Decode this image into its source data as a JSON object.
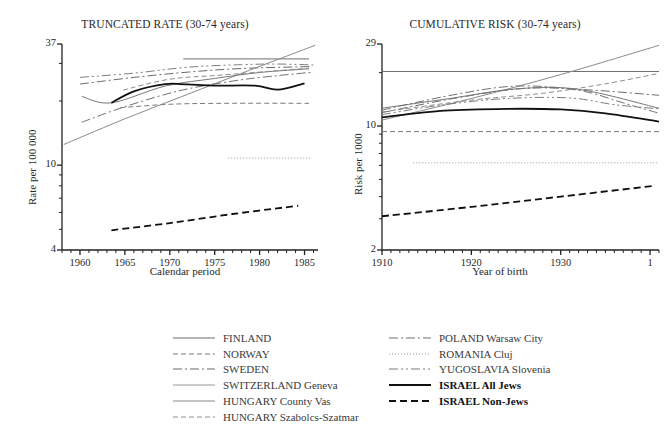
{
  "chart_data": [
    {
      "type": "line",
      "title": "TRUNCATED RATE (30-74 years)",
      "xlabel": "Calendar period",
      "ylabel": "Rate per 100 000",
      "xlim": [
        1958,
        1986.5
      ],
      "ylim": [
        4,
        37
      ],
      "yscale": "log",
      "grid": false,
      "xticks": [
        1960,
        1965,
        1970,
        1975,
        1980,
        1985
      ],
      "xtick_labels": [
        "1960",
        "1965",
        "1970",
        "1975",
        "1980",
        "1985"
      ],
      "yticks": [
        4,
        10,
        37
      ],
      "ytick_labels": [
        "4",
        "10",
        "37"
      ],
      "legend_position": "below",
      "series": [
        {
          "name": "FINLAND",
          "style": "solid",
          "color": "#6f6f6f",
          "width": 1.0,
          "x": [
            1971.5,
            1985.5
          ],
          "y": [
            31.5,
            31.5
          ]
        },
        {
          "name": "NORWAY",
          "style": "dashed",
          "color": "#7a7a7a",
          "width": 1.0,
          "x": [
            1964.5,
            1970,
            1976,
            1985.5
          ],
          "y": [
            18.6,
            19.3,
            19.5,
            19.5
          ]
        },
        {
          "name": "SWEDEN",
          "style": "dashdot",
          "color": "#6a6a6a",
          "width": 1.0,
          "x": [
            1960,
            1966,
            1972,
            1978,
            1985.8
          ],
          "y": [
            24.0,
            25.8,
            27.3,
            28.4,
            29.0
          ]
        },
        {
          "name": "SWITZERLAND Geneva",
          "style": "solid",
          "color": "#8a8a8a",
          "width": 1.0,
          "x": [
            1958.2,
            1965,
            1972,
            1979,
            1986.2
          ],
          "y": [
            12.5,
            16.5,
            21.5,
            28.0,
            36.5
          ]
        },
        {
          "name": "HUNGARY County Vas",
          "style": "solid",
          "color": "#787878",
          "width": 1.0,
          "x": [
            1960.2,
            1963.5,
            1969.5,
            1975,
            1980,
            1985.5
          ],
          "y": [
            21.0,
            19.6,
            23.5,
            25.5,
            27.2,
            28.3
          ]
        },
        {
          "name": "HUNGARY Szabolcs-Szatmar",
          "style": "dashed",
          "color": "#8d8d8d",
          "width": 1.0,
          "x": [
            1964.8,
            1970,
            1976,
            1985.5
          ],
          "y": [
            22.5,
            25.3,
            26.5,
            28.5
          ]
        },
        {
          "name": "POLAND Warsaw City",
          "style": "dashdot",
          "color": "#717171",
          "width": 1.0,
          "x": [
            1960.2,
            1965,
            1971,
            1977,
            1982,
            1986
          ],
          "y": [
            15.9,
            18.8,
            22.3,
            24.8,
            26.3,
            27.3
          ]
        },
        {
          "name": "ROMANIA Cluj",
          "style": "dotted",
          "color": "#9a9a9a",
          "width": 1.0,
          "x": [
            1976.5,
            1985.8
          ],
          "y": [
            10.8,
            10.8
          ]
        },
        {
          "name": "YUGOSLAVIA Slovenia",
          "style": "dashdotdot",
          "color": "#7d7d7d",
          "width": 1.0,
          "x": [
            1960,
            1966,
            1972,
            1978,
            1982,
            1986
          ],
          "y": [
            25.8,
            27.0,
            28.8,
            29.6,
            29.8,
            29.5
          ]
        },
        {
          "name": "ISRAEL All Jews",
          "style": "solid",
          "color": "#111111",
          "width": 1.8,
          "x": [
            1963.5,
            1966,
            1969.5,
            1972,
            1975,
            1979.5,
            1982,
            1985
          ],
          "y": [
            19.6,
            22.2,
            24.0,
            23.9,
            23.6,
            23.6,
            22.6,
            24.2
          ]
        },
        {
          "name": "ISRAEL Non-Jews",
          "style": "dashed",
          "color": "#111111",
          "width": 1.8,
          "x": [
            1963.5,
            1970,
            1977,
            1984.3
          ],
          "y": [
            4.95,
            5.35,
            5.9,
            6.45
          ]
        }
      ]
    },
    {
      "type": "line",
      "title": "CUMULATIVE RISK (30-74 years)",
      "xlabel": "Year of birth",
      "ylabel": "Risk per 1000",
      "xlim": [
        1910,
        1941
      ],
      "ylim": [
        2,
        29
      ],
      "yscale": "log",
      "grid": false,
      "xticks": [
        1910,
        1920,
        1930,
        1940
      ],
      "xtick_labels": [
        "1910",
        "1920",
        "1930",
        "1"
      ],
      "yticks": [
        2,
        10,
        29
      ],
      "ytick_labels": [
        "2",
        "10",
        "29"
      ],
      "legend_position": "below",
      "series": [
        {
          "name": "FINLAND",
          "style": "solid",
          "color": "#6f6f6f",
          "width": 1.0,
          "x": [
            1910,
            1941
          ],
          "y": [
            20.3,
            20.3
          ]
        },
        {
          "name": "NORWAY",
          "style": "dashed",
          "color": "#7a7a7a",
          "width": 1.0,
          "x": [
            1910,
            1941
          ],
          "y": [
            9.3,
            9.3
          ]
        },
        {
          "name": "SWEDEN",
          "style": "dashdot",
          "color": "#6a6a6a",
          "width": 1.0,
          "x": [
            1910,
            1918,
            1926,
            1933,
            1941
          ],
          "y": [
            11.9,
            14.3,
            16.3,
            16.0,
            14.9
          ]
        },
        {
          "name": "SWITZERLAND Geneva",
          "style": "solid",
          "color": "#8a8a8a",
          "width": 1.0,
          "x": [
            1910,
            1920,
            1930,
            1941
          ],
          "y": [
            10.8,
            14.3,
            19.5,
            28.5
          ]
        },
        {
          "name": "HUNGARY County Vas",
          "style": "solid",
          "color": "#787878",
          "width": 1.0,
          "x": [
            1910,
            1918,
            1925,
            1932,
            1941
          ],
          "y": [
            12.6,
            14.4,
            16.2,
            16.1,
            12.6
          ]
        },
        {
          "name": "HUNGARY Szabolcs-Szatmar",
          "style": "dashed",
          "color": "#8d8d8d",
          "width": 1.0,
          "x": [
            1910,
            1920,
            1928,
            1935,
            1941
          ],
          "y": [
            12.0,
            14.0,
            15.3,
            17.3,
            19.8
          ]
        },
        {
          "name": "POLAND Warsaw City",
          "style": "dashdot",
          "color": "#717171",
          "width": 1.0,
          "x": [
            1910,
            1918,
            1925,
            1932,
            1937,
            1941
          ],
          "y": [
            12.3,
            15.0,
            16.8,
            15.9,
            13.5,
            11.8
          ]
        },
        {
          "name": "ROMANIA Cluj",
          "style": "dotted",
          "color": "#9a9a9a",
          "width": 1.0,
          "x": [
            1913.5,
            1941
          ],
          "y": [
            6.2,
            6.2
          ]
        },
        {
          "name": "YUGOSLAVIA Slovenia",
          "style": "dashdotdot",
          "color": "#7d7d7d",
          "width": 1.0,
          "x": [
            1910,
            1917,
            1924,
            1931,
            1936,
            1941
          ],
          "y": [
            11.6,
            13.2,
            14.3,
            14.4,
            13.2,
            12.5
          ]
        },
        {
          "name": "ISRAEL All Jews",
          "style": "solid",
          "color": "#111111",
          "width": 1.8,
          "x": [
            1910,
            1917,
            1924,
            1930,
            1935,
            1941
          ],
          "y": [
            11.2,
            12.2,
            12.5,
            12.4,
            11.8,
            10.6
          ]
        },
        {
          "name": "ISRAEL Non-Jews",
          "style": "dashed",
          "color": "#111111",
          "width": 1.8,
          "x": [
            1910,
            1920,
            1930,
            1940.5
          ],
          "y": [
            3.1,
            3.5,
            4.0,
            4.6
          ]
        }
      ]
    }
  ],
  "legend": {
    "columns": [
      {
        "items": [
          {
            "label": "FINLAND",
            "style": "solid",
            "color": "#6f6f6f",
            "width": 1.2,
            "bold": false
          },
          {
            "label": "NORWAY",
            "style": "dashed",
            "color": "#7a7a7a",
            "width": 1.2,
            "bold": false
          },
          {
            "label": "SWEDEN",
            "style": "dashdot",
            "color": "#6a6a6a",
            "width": 1.2,
            "bold": false
          },
          {
            "label": "SWITZERLAND Geneva",
            "style": "solid",
            "color": "#9a9a9a",
            "width": 1.2,
            "bold": false
          },
          {
            "label": "HUNGARY County Vas",
            "style": "solid",
            "color": "#8a8a8a",
            "width": 1.2,
            "bold": false
          },
          {
            "label": "HUNGARY Szabolcs-Szatmar",
            "style": "dashed",
            "color": "#8d8d8d",
            "width": 1.2,
            "bold": false
          }
        ]
      },
      {
        "items": [
          {
            "label": "POLAND Warsaw City",
            "style": "dashdot",
            "color": "#717171",
            "width": 1.2,
            "bold": false
          },
          {
            "label": "ROMANIA Cluj",
            "style": "dotted",
            "color": "#9a9a9a",
            "width": 1.2,
            "bold": false
          },
          {
            "label": "YUGOSLAVIA Slovenia",
            "style": "dashdotdot",
            "color": "#7d7d7d",
            "width": 1.2,
            "bold": false
          },
          {
            "label": "ISRAEL All Jews",
            "style": "solid",
            "color": "#111111",
            "width": 2.2,
            "bold": true
          },
          {
            "label": "ISRAEL Non-Jews",
            "style": "dashed",
            "color": "#111111",
            "width": 2.2,
            "bold": true
          }
        ]
      }
    ]
  }
}
